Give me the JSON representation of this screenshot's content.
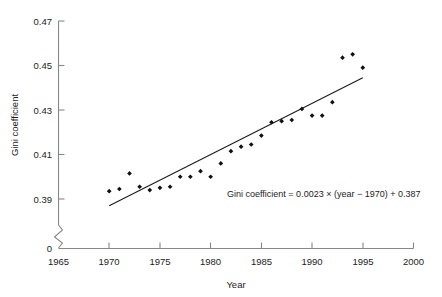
{
  "chart_data": {
    "type": "scatter",
    "title": "",
    "xlabel": "Year",
    "ylabel": "Gini coefficient",
    "xlim": [
      1965,
      2000
    ],
    "ylim": [
      0.385,
      0.47
    ],
    "y_axis_break": true,
    "y_axis_break_label": "0",
    "grid": false,
    "legend": null,
    "xticks": [
      1965,
      1970,
      1975,
      1980,
      1985,
      1990,
      1995,
      2000
    ],
    "xtick_labels": [
      "1965",
      "1970",
      "1975",
      "1980",
      "1985",
      "1990",
      "1995",
      "2000"
    ],
    "yticks": [
      0.39,
      0.41,
      0.43,
      0.45,
      0.47
    ],
    "ytick_labels": [
      "0.39",
      "0.41",
      "0.43",
      "0.45",
      "0.47"
    ],
    "series": [
      {
        "name": "Gini coefficient",
        "marker": "diamond",
        "color": "#111111",
        "x": [
          1970,
          1971,
          1972,
          1973,
          1974,
          1975,
          1976,
          1977,
          1978,
          1979,
          1980,
          1981,
          1982,
          1983,
          1984,
          1985,
          1986,
          1987,
          1988,
          1989,
          1990,
          1991,
          1992,
          1993,
          1994,
          1995
        ],
        "y": [
          0.3935,
          0.3945,
          0.4015,
          0.3955,
          0.394,
          0.395,
          0.3955,
          0.4,
          0.4,
          0.4025,
          0.4,
          0.406,
          0.4115,
          0.4135,
          0.4145,
          0.4185,
          0.4245,
          0.425,
          0.4255,
          0.4305,
          0.4275,
          0.4275,
          0.4335,
          0.4535,
          0.455,
          0.449
        ]
      }
    ],
    "fit_line": {
      "equation_text": "Gini coefficient = 0.0023 × (year − 1970) + 0.387",
      "slope": 0.0023,
      "intercept_year": 1970,
      "intercept_value": 0.387,
      "x_start": 1970,
      "x_end": 1995,
      "y_start": 0.387,
      "y_end": 0.4445,
      "color": "#1a1a1a"
    },
    "annotations": [
      {
        "name": "equation-annotation",
        "text": "Gini coefficient = 0.0023 × (year − 1970) + 0.387",
        "x": 1986.5,
        "y": 0.3935
      }
    ]
  },
  "colors": {
    "marker": "#111111",
    "fit_line": "#1a1a1a",
    "axis": "#878787",
    "text": "#1c1c1c",
    "background": "#ffffff"
  }
}
